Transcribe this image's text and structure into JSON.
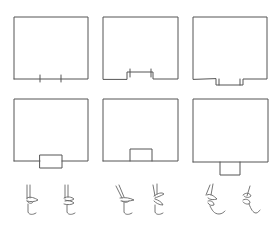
{
  "figure": {
    "type": "articulation-diagram",
    "stroke_color": "#555555",
    "background": "#ffffff"
  },
  "panels": [
    {
      "id": 1,
      "row": 1,
      "col": 1,
      "variant": "tick-marks",
      "frame": {
        "x": 14,
        "y": 17,
        "w": 74,
        "h": 62
      },
      "feature": {
        "ticks_x": [
          40,
          61
        ],
        "tick_len": 6
      }
    },
    {
      "id": 2,
      "row": 1,
      "col": 2,
      "variant": "raised-notch",
      "frame": {
        "x": 103,
        "y": 17,
        "w": 75,
        "h": 62
      },
      "feature": {
        "x1": 127,
        "x2": 153,
        "raise_to_y": 72
      }
    },
    {
      "id": 3,
      "row": 1,
      "col": 3,
      "variant": "lowered-notch",
      "frame": {
        "x": 193,
        "y": 17,
        "w": 74,
        "h": 62
      },
      "feature": {
        "x1": 216,
        "x2": 243,
        "drop_to_y": 85
      }
    },
    {
      "id": 4,
      "row": 2,
      "col": 1,
      "variant": "straddling-block",
      "frame": {
        "x": 14,
        "y": 99,
        "w": 74,
        "h": 62
      },
      "feature": {
        "x": 40,
        "y": 155,
        "w": 22,
        "h": 13
      }
    },
    {
      "id": 5,
      "row": 2,
      "col": 2,
      "variant": "inner-block",
      "frame": {
        "x": 103,
        "y": 99,
        "w": 75,
        "h": 62
      },
      "feature": {
        "x": 130,
        "y": 149,
        "w": 22,
        "h": 12
      }
    },
    {
      "id": 6,
      "row": 2,
      "col": 3,
      "variant": "outer-block",
      "frame": {
        "x": 193,
        "y": 99,
        "w": 75,
        "h": 63
      },
      "feature": {
        "x": 220,
        "y": 162,
        "w": 20,
        "h": 13
      }
    }
  ],
  "lip_profiles": [
    {
      "group": 1,
      "items": [
        "closed-lips-left",
        "closed-lips-right"
      ]
    },
    {
      "group": 2,
      "items": [
        "protruding-lips-left",
        "protruding-lips-right"
      ]
    },
    {
      "group": 3,
      "items": [
        "rounded-lips-left",
        "rounded-lips-right"
      ]
    }
  ]
}
